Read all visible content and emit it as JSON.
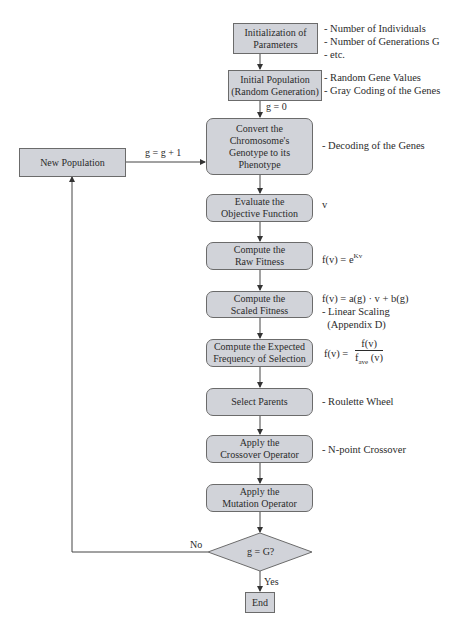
{
  "flowchart": {
    "steps": [
      {
        "id": "init",
        "label": "Initialization of\nParameters"
      },
      {
        "id": "initpop",
        "label": "Initial Population\n(Random Generation)"
      },
      {
        "id": "convert",
        "label": "Convert the\nChromosome's\nGenotype to its\nPhenotype"
      },
      {
        "id": "evaluate",
        "label": "Evaluate the\nObjective Function"
      },
      {
        "id": "raw",
        "label": "Compute the\nRaw Fitness"
      },
      {
        "id": "scaled",
        "label": "Compute the\nScaled Fitness"
      },
      {
        "id": "expected",
        "label": "Compute the Expected\nFrequency of Selection"
      },
      {
        "id": "select",
        "label": "Select Parents"
      },
      {
        "id": "crossover",
        "label": "Apply the\nCrossover Operator"
      },
      {
        "id": "mutation",
        "label": "Apply the\nMutation Operator"
      }
    ],
    "new_population": "New Population",
    "decision": "g = G?",
    "end": "End",
    "edge_labels": {
      "g_init": "g = 0",
      "g_increment": "g = g + 1",
      "no": "No",
      "yes": "Yes"
    },
    "notes": {
      "init": "- Number of Individuals\n- Number of Generations G\n- etc.",
      "initpop": "- Random Gene Values\n- Gray Coding of the Genes",
      "convert": "- Decoding of the Genes",
      "evaluate": "v",
      "raw_prefix": "f(v) = e",
      "raw_exp": "Kv",
      "scaled": "f(v) = a(g) · v + b(g)\n- Linear Scaling\n  (Appendix D)",
      "expected_prefix": "f(v) = ",
      "expected_num": "f(v)",
      "expected_den_base": "f",
      "expected_den_sub": "ave",
      "expected_den_tail": " (v)",
      "select": "- Roulette Wheel",
      "crossover": "- N-point Crossover"
    }
  }
}
